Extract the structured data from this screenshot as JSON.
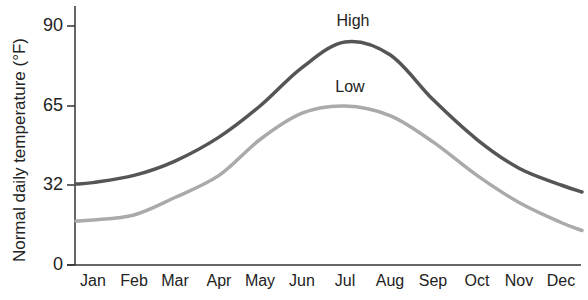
{
  "chart_data": {
    "type": "line",
    "title": "",
    "xlabel": "",
    "ylabel": "Normal daily temperature (°F)",
    "categories": [
      "Jan",
      "Feb",
      "Mar",
      "Apr",
      "May",
      "Jun",
      "Jul",
      "Aug",
      "Sep",
      "Oct",
      "Nov",
      "Dec"
    ],
    "yticks": [
      0,
      32,
      65,
      90
    ],
    "ylim": [
      0,
      96
    ],
    "grid": false,
    "legend": "inline labels above curves",
    "series": [
      {
        "name": "High",
        "color": "#555555",
        "values": [
          33,
          36,
          42,
          52,
          65,
          77,
          85,
          81,
          67,
          51,
          39,
          32
        ]
      },
      {
        "name": "Low",
        "color": "#aaaaaa",
        "values": [
          18,
          20,
          27,
          36,
          51,
          62,
          65,
          61,
          50,
          36,
          25,
          17
        ]
      }
    ],
    "annotations": [
      {
        "text": "High",
        "near": "Jul"
      },
      {
        "text": "Low",
        "near": "Jul"
      }
    ]
  }
}
